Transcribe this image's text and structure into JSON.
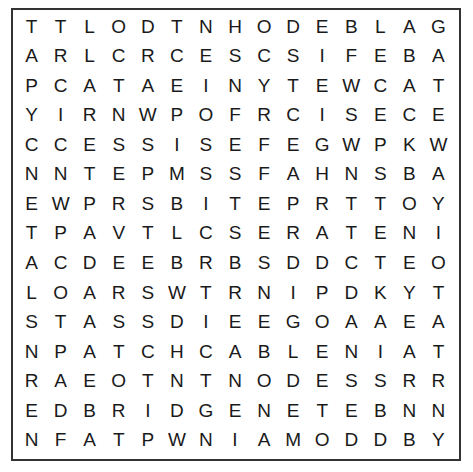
{
  "puzzle": {
    "type": "word-search",
    "rows": 15,
    "cols": 15,
    "grid": [
      [
        "T",
        "T",
        "L",
        "O",
        "D",
        "T",
        "N",
        "H",
        "O",
        "D",
        "E",
        "B",
        "L",
        "A",
        "G"
      ],
      [
        "A",
        "R",
        "L",
        "C",
        "R",
        "C",
        "E",
        "S",
        "C",
        "S",
        "I",
        "F",
        "E",
        "B",
        "A"
      ],
      [
        "P",
        "C",
        "A",
        "T",
        "A",
        "E",
        "I",
        "N",
        "Y",
        "T",
        "E",
        "W",
        "C",
        "A",
        "T"
      ],
      [
        "Y",
        "I",
        "R",
        "N",
        "W",
        "P",
        "O",
        "F",
        "R",
        "C",
        "I",
        "S",
        "E",
        "C",
        "E"
      ],
      [
        "C",
        "C",
        "E",
        "S",
        "S",
        "I",
        "S",
        "E",
        "F",
        "E",
        "G",
        "W",
        "P",
        "K",
        "W"
      ],
      [
        "N",
        "N",
        "T",
        "E",
        "P",
        "M",
        "S",
        "S",
        "F",
        "A",
        "H",
        "N",
        "S",
        "B",
        "A"
      ],
      [
        "E",
        "W",
        "P",
        "R",
        "S",
        "B",
        "I",
        "T",
        "E",
        "P",
        "R",
        "T",
        "T",
        "O",
        "Y"
      ],
      [
        "T",
        "P",
        "A",
        "V",
        "T",
        "L",
        "C",
        "S",
        "E",
        "R",
        "A",
        "T",
        "E",
        "N",
        "I"
      ],
      [
        "A",
        "C",
        "D",
        "E",
        "E",
        "B",
        "R",
        "B",
        "S",
        "D",
        "D",
        "C",
        "T",
        "E",
        "O"
      ],
      [
        "L",
        "O",
        "A",
        "R",
        "S",
        "W",
        "T",
        "R",
        "N",
        "I",
        "P",
        "D",
        "K",
        "Y",
        "T"
      ],
      [
        "S",
        "T",
        "A",
        "S",
        "S",
        "D",
        "I",
        "E",
        "E",
        "G",
        "O",
        "A",
        "A",
        "E",
        "A"
      ],
      [
        "N",
        "P",
        "A",
        "T",
        "C",
        "H",
        "C",
        "A",
        "B",
        "L",
        "E",
        "N",
        "I",
        "A",
        "T"
      ],
      [
        "R",
        "A",
        "E",
        "O",
        "T",
        "N",
        "T",
        "N",
        "O",
        "D",
        "E",
        "S",
        "S",
        "R",
        "R"
      ],
      [
        "E",
        "D",
        "B",
        "R",
        "I",
        "D",
        "G",
        "E",
        "N",
        "E",
        "T",
        "E",
        "B",
        "N",
        "N"
      ],
      [
        "N",
        "F",
        "A",
        "T",
        "P",
        "W",
        "N",
        "I",
        "A",
        "M",
        "O",
        "D",
        "D",
        "B",
        "Y"
      ]
    ]
  },
  "colors": {
    "border": "#333333",
    "text": "#1a1a1a",
    "background": "#ffffff"
  }
}
